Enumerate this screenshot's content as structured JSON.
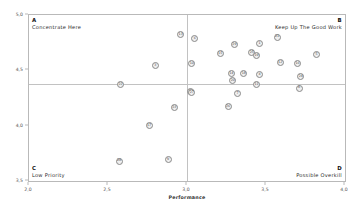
{
  "chart_data": {
    "type": "scatter",
    "title": "",
    "xlabel": "Performance",
    "ylabel": "Importance",
    "xlim": [
      2.0,
      4.0
    ],
    "ylim": [
      3.5,
      5.0
    ],
    "xticks": [
      "2,0",
      "2,5",
      "3,0",
      "3,5",
      "4,0"
    ],
    "xtick_values": [
      2.0,
      2.5,
      3.0,
      3.5,
      4.0
    ],
    "yticks": [
      "5,0",
      "4,5",
      "4,0",
      "3,5"
    ],
    "ytick_values": [
      5.0,
      4.5,
      4.0,
      3.5
    ],
    "grid": false,
    "legend": "none",
    "crosshair": {
      "x": 3.0,
      "y": 4.38
    },
    "quadrants": [
      {
        "id": "A",
        "letter": "A",
        "label": "Concentrate Here",
        "corner": "top-left"
      },
      {
        "id": "B",
        "letter": "B",
        "label": "Keep Up The Good Work",
        "corner": "top-right"
      },
      {
        "id": "C",
        "letter": "C",
        "label": "Low Priority",
        "corner": "bottom-left"
      },
      {
        "id": "D",
        "letter": "D",
        "label": "Possible Overkill",
        "corner": "bottom-right"
      }
    ],
    "points": [
      {
        "label": "13",
        "x": 2.96,
        "y": 4.82
      },
      {
        "label": "6",
        "x": 3.05,
        "y": 4.79
      },
      {
        "label": "21",
        "x": 3.57,
        "y": 4.8
      },
      {
        "label": "1",
        "x": 3.46,
        "y": 4.74
      },
      {
        "label": "29",
        "x": 3.3,
        "y": 4.73
      },
      {
        "label": "25",
        "x": 3.41,
        "y": 4.66
      },
      {
        "label": "15",
        "x": 3.21,
        "y": 4.65
      },
      {
        "label": "19",
        "x": 3.44,
        "y": 4.63
      },
      {
        "label": "5",
        "x": 3.82,
        "y": 4.64
      },
      {
        "label": "12",
        "x": 3.59,
        "y": 4.57
      },
      {
        "label": "16",
        "x": 3.7,
        "y": 4.56
      },
      {
        "label": "10",
        "x": 3.03,
        "y": 4.56
      },
      {
        "label": "3",
        "x": 2.8,
        "y": 4.54
      },
      {
        "label": "14",
        "x": 3.28,
        "y": 4.47
      },
      {
        "label": "18",
        "x": 3.36,
        "y": 4.47
      },
      {
        "label": "4",
        "x": 3.46,
        "y": 4.46
      },
      {
        "label": "24",
        "x": 3.72,
        "y": 4.44
      },
      {
        "label": "20",
        "x": 3.29,
        "y": 4.41
      },
      {
        "label": "22",
        "x": 2.58,
        "y": 4.37
      },
      {
        "label": "11",
        "x": 3.44,
        "y": 4.37
      },
      {
        "label": "8",
        "x": 3.71,
        "y": 4.34
      },
      {
        "label": "2",
        "x": 3.02,
        "y": 4.31
      },
      {
        "label": "27",
        "x": 3.03,
        "y": 4.3
      },
      {
        "label": "7",
        "x": 3.32,
        "y": 4.29
      },
      {
        "label": "26",
        "x": 3.26,
        "y": 4.17
      },
      {
        "label": "23",
        "x": 2.92,
        "y": 4.16
      },
      {
        "label": "17",
        "x": 2.76,
        "y": 4.0
      },
      {
        "label": "9",
        "x": 2.88,
        "y": 3.69
      },
      {
        "label": "28",
        "x": 2.57,
        "y": 3.68
      }
    ]
  }
}
